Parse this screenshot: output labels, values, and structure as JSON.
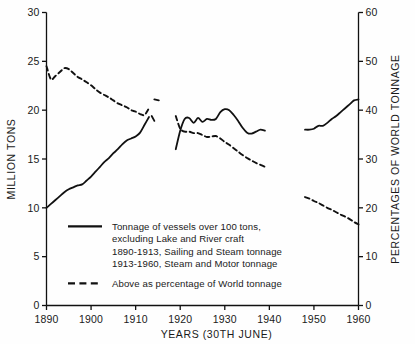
{
  "chart_data": {
    "type": "line",
    "title": "",
    "xlabel": "YEARS  (30TH JUNE)",
    "ylabel": "MILLION TONS",
    "ylabel_right": "PERCENTAGES OF WORLD TONNAGE",
    "xlim": [
      1890,
      1960
    ],
    "ylim": [
      0,
      30
    ],
    "ylim_right": [
      0,
      60
    ],
    "grid": false,
    "xticks": [
      1890,
      1900,
      1910,
      1920,
      1930,
      1940,
      1950,
      1960
    ],
    "xtick_labels": [
      "1890",
      "1900",
      "1910",
      "1920",
      "1930",
      "1940",
      "1950",
      "1960"
    ],
    "yticks": [
      0,
      5,
      10,
      15,
      20,
      25,
      30
    ],
    "ytick_labels": [
      "0",
      "5",
      "10",
      "15",
      "20",
      "25",
      "30"
    ],
    "yticks_right": [
      0,
      10,
      20,
      30,
      40,
      50,
      60
    ],
    "ytick_labels_right": [
      "0",
      "10",
      "20",
      "30",
      "40",
      "50",
      "60"
    ],
    "legend_position": "lower-center",
    "series": [
      {
        "name": "Tonnage of vessels over 100 tons",
        "axis": "left",
        "style": "solid",
        "color": "#111111",
        "segments": [
          {
            "label": "1890-1913",
            "x": [
              1890,
              1891,
              1892,
              1893,
              1894,
              1895,
              1896,
              1897,
              1898,
              1899,
              1900,
              1901,
              1902,
              1903,
              1904,
              1905,
              1906,
              1907,
              1908,
              1909,
              1910,
              1911,
              1912,
              1913
            ],
            "y": [
              10.0,
              10.4,
              10.8,
              11.2,
              11.6,
              11.9,
              12.1,
              12.3,
              12.4,
              12.8,
              13.2,
              13.7,
              14.2,
              14.7,
              15.1,
              15.6,
              16.0,
              16.5,
              16.9,
              17.1,
              17.3,
              17.7,
              18.5,
              19.3
            ]
          },
          {
            "label": "1914-1918 (gap)",
            "x": [
              1913.6,
              1914.2
            ],
            "y": [
              19.4,
              18.9
            ]
          },
          {
            "label": "1919-1939",
            "x": [
              1919,
              1920,
              1921,
              1922,
              1923,
              1924,
              1925,
              1926,
              1927,
              1928,
              1929,
              1930,
              1931,
              1932,
              1933,
              1934,
              1935,
              1936,
              1937,
              1938,
              1939
            ],
            "y": [
              16.0,
              17.9,
              19.1,
              19.2,
              18.7,
              19.2,
              18.8,
              19.1,
              19.0,
              19.1,
              19.8,
              20.1,
              20.0,
              19.5,
              18.9,
              18.2,
              17.7,
              17.6,
              17.8,
              18.0,
              17.9
            ]
          },
          {
            "label": "1948-1960",
            "x": [
              1948,
              1949,
              1950,
              1951,
              1952,
              1953,
              1954,
              1955,
              1956,
              1957,
              1958,
              1959,
              1960
            ],
            "y": [
              18.0,
              18.0,
              18.1,
              18.4,
              18.4,
              18.7,
              19.1,
              19.4,
              19.8,
              20.2,
              20.6,
              21.0,
              21.1
            ]
          }
        ]
      },
      {
        "name": "Above as percentage of World tonnage",
        "axis": "right",
        "style": "dashed",
        "color": "#111111",
        "segments": [
          {
            "label": "1890-1913",
            "x": [
              1890,
              1891,
              1892,
              1893,
              1894,
              1895,
              1896,
              1897,
              1898,
              1899,
              1900,
              1901,
              1902,
              1903,
              1904,
              1905,
              1906,
              1907,
              1908,
              1909,
              1910,
              1911,
              1912,
              1913
            ],
            "y": [
              49.0,
              46.3,
              47.0,
              47.8,
              48.6,
              48.4,
              47.6,
              46.8,
              46.3,
              45.7,
              45.1,
              44.3,
              43.6,
              43.1,
              42.6,
              42.0,
              41.4,
              41.0,
              40.6,
              40.0,
              39.7,
              39.2,
              39.0,
              40.4
            ]
          },
          {
            "label": "1914-1918 (gap)",
            "x": [
              1914.2,
              1915.2
            ],
            "y": [
              42.2,
              42.0
            ]
          },
          {
            "label": "1919-1939",
            "x": [
              1919,
              1920,
              1921,
              1922,
              1923,
              1924,
              1925,
              1926,
              1927,
              1928,
              1929,
              1930,
              1931,
              1932,
              1933,
              1934,
              1935,
              1936,
              1937,
              1938,
              1939
            ],
            "y": [
              38.8,
              36.2,
              35.6,
              35.6,
              35.3,
              35.3,
              34.9,
              34.5,
              34.6,
              34.7,
              34.2,
              33.5,
              32.9,
              32.2,
              31.5,
              30.8,
              30.2,
              29.7,
              29.2,
              28.8,
              28.4
            ]
          },
          {
            "label": "1948-1960",
            "x": [
              1948,
              1949,
              1950,
              1951,
              1952,
              1953,
              1954,
              1955,
              1956,
              1957,
              1958,
              1959,
              1960
            ],
            "y": [
              22.2,
              21.9,
              21.4,
              21.0,
              20.5,
              20.0,
              19.6,
              19.1,
              18.6,
              18.2,
              17.7,
              17.1,
              16.6
            ]
          }
        ]
      }
    ],
    "legend": {
      "solid_lines": [
        "Tonnage of vessels over 100 tons,",
        "excluding Lake and River craft",
        "1890-1913, Sailing and Steam tonnage",
        "1913-1960, Steam and Motor tonnage"
      ],
      "dashed_lines": [
        "Above as percentage of  World tonnage"
      ]
    }
  }
}
